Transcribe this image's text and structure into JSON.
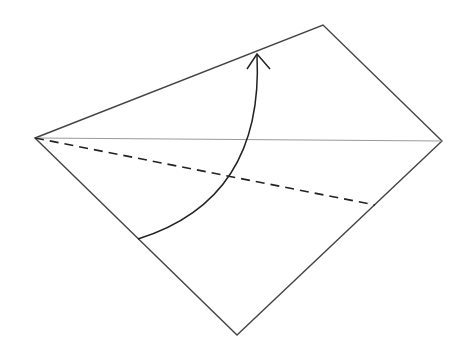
{
  "diagram": {
    "type": "origami-fold-step",
    "background": "#ffffff",
    "stroke_color": "#3a3a3a",
    "paper": {
      "vertices": {
        "left": [
          35,
          138
        ],
        "top": [
          323,
          25
        ],
        "right": [
          442,
          141
        ],
        "bottom": [
          237,
          335
        ]
      }
    },
    "diagonal_line": {
      "from": [
        35,
        138
      ],
      "to": [
        442,
        141
      ]
    },
    "valley_fold_line": {
      "style": "dashed",
      "from": [
        35,
        138
      ],
      "to": [
        375,
        205
      ]
    },
    "fold_arrow": {
      "start": [
        138,
        239
      ],
      "tip": [
        257,
        54
      ],
      "direction": "up"
    }
  }
}
